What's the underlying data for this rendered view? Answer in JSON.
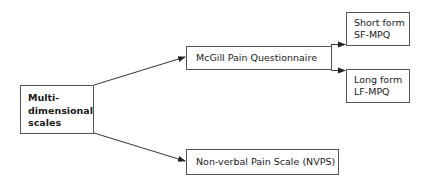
{
  "diagram": {
    "root": {
      "lines": [
        "Multi-",
        "dimensional",
        "scales"
      ]
    },
    "children": [
      {
        "label": "McGill Pain Questionnaire",
        "children": [
          {
            "lines": [
              "Short form",
              "SF-MPQ"
            ]
          },
          {
            "lines": [
              "Long form",
              "LF-MPQ"
            ]
          }
        ]
      },
      {
        "label": "Non-verbal Pain Scale (NVPS)"
      }
    ],
    "colors": {
      "line": "#333333",
      "border": "#555555",
      "text": "#1a1a1a"
    }
  }
}
